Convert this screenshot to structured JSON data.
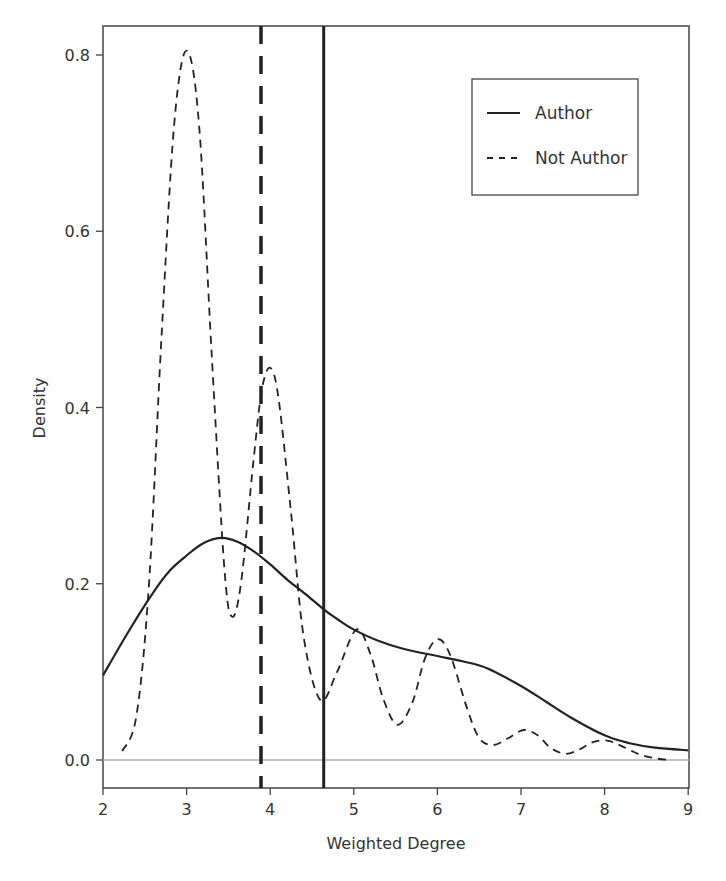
{
  "chart_data": {
    "type": "line",
    "title": "",
    "xlabel": "Weighted Degree",
    "ylabel": "Density",
    "xlim": [
      2,
      9
    ],
    "ylim": [
      -0.035,
      0.83
    ],
    "xticks": [
      2,
      3,
      4,
      5,
      6,
      7,
      8,
      9
    ],
    "xtick_labels": [
      "2",
      "3",
      "4",
      "5",
      "6",
      "7",
      "8",
      "9"
    ],
    "yticks": [
      0.0,
      0.2,
      0.4,
      0.6,
      0.8
    ],
    "ytick_labels": [
      "0.0",
      "0.2",
      "0.4",
      "0.6",
      "0.8"
    ],
    "grid": false,
    "legend_position": "upper right",
    "reference_lines": [
      {
        "type": "horizontal",
        "y": 0.0,
        "color": "#b0b0b0",
        "style": "solid"
      },
      {
        "type": "vertical",
        "x": 3.89,
        "series": "Not Author",
        "style": "dashed",
        "note": "mean"
      },
      {
        "type": "vertical",
        "x": 4.64,
        "series": "Author",
        "style": "solid",
        "note": "mean"
      }
    ],
    "series": [
      {
        "name": "Author",
        "style": "solid",
        "color": "#222222",
        "x": [
          2.0,
          2.3,
          2.6,
          2.8,
          3.0,
          3.2,
          3.41,
          3.6,
          3.8,
          4.0,
          4.2,
          4.4,
          4.64,
          4.8,
          5.0,
          5.3,
          5.6,
          6.0,
          6.3,
          6.6,
          7.0,
          7.3,
          7.6,
          8.0,
          8.3,
          8.6,
          9.0
        ],
        "y": [
          0.096,
          0.145,
          0.19,
          0.215,
          0.232,
          0.246,
          0.252,
          0.248,
          0.237,
          0.222,
          0.205,
          0.19,
          0.171,
          0.16,
          0.148,
          0.135,
          0.126,
          0.118,
          0.112,
          0.104,
          0.084,
          0.066,
          0.048,
          0.028,
          0.019,
          0.014,
          0.011
        ]
      },
      {
        "name": "Not Author",
        "style": "dashed",
        "color": "#222222",
        "x": [
          2.23,
          2.4,
          2.55,
          2.7,
          2.85,
          3.0,
          3.15,
          3.3,
          3.45,
          3.54,
          3.65,
          3.8,
          3.9,
          4.0,
          4.1,
          4.25,
          4.4,
          4.6,
          4.8,
          5.03,
          5.2,
          5.35,
          5.52,
          5.7,
          5.85,
          6.0,
          6.15,
          6.35,
          6.5,
          6.67,
          6.85,
          7.03,
          7.2,
          7.35,
          7.53,
          7.7,
          7.85,
          8.03,
          8.2,
          8.4,
          8.6,
          8.78
        ],
        "y": [
          0.01,
          0.05,
          0.2,
          0.48,
          0.72,
          0.805,
          0.72,
          0.46,
          0.22,
          0.163,
          0.2,
          0.34,
          0.42,
          0.445,
          0.41,
          0.28,
          0.14,
          0.068,
          0.1,
          0.148,
          0.12,
          0.07,
          0.04,
          0.065,
          0.115,
          0.137,
          0.12,
          0.06,
          0.025,
          0.017,
          0.025,
          0.034,
          0.028,
          0.014,
          0.007,
          0.012,
          0.02,
          0.022,
          0.016,
          0.007,
          0.002,
          0.0
        ]
      }
    ]
  },
  "legend": {
    "items": [
      {
        "label": "Author",
        "style": "solid"
      },
      {
        "label": "Not Author",
        "style": "dashed"
      }
    ]
  },
  "axes": {
    "xlabel": "Weighted Degree",
    "ylabel": "Density"
  },
  "colors": {
    "line": "#222222",
    "axis": "#444444",
    "zero_line": "#b0b0b0",
    "text": "#333333"
  }
}
